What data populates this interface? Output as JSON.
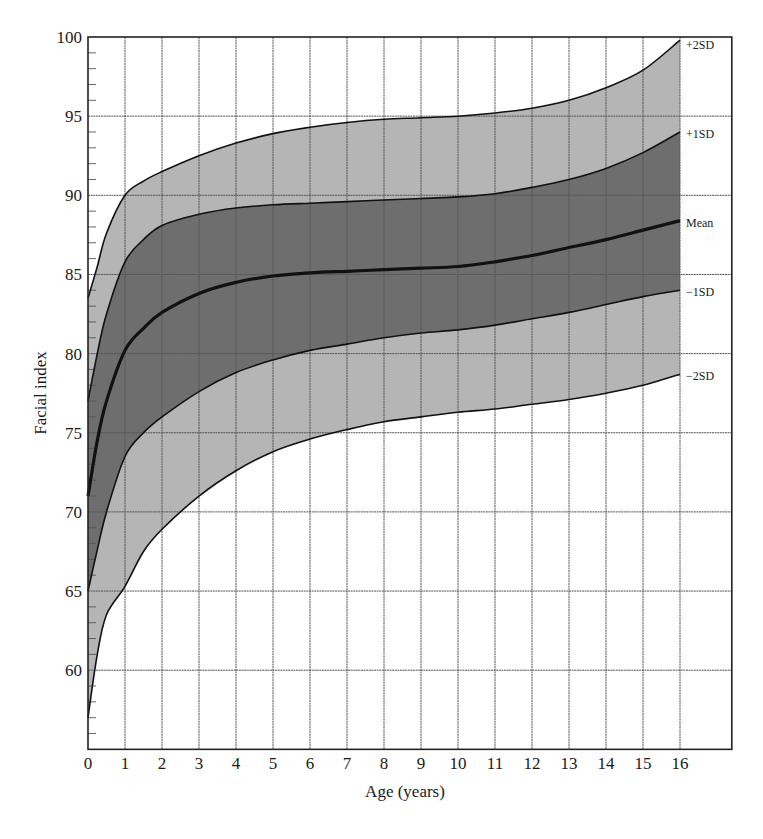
{
  "chart_data": {
    "type": "area",
    "title": "",
    "xlabel": "Age (years)",
    "ylabel": "Facial index",
    "xlim": [
      0,
      17.4
    ],
    "ylim": [
      55,
      100
    ],
    "grid": true,
    "x_ticks": [
      0,
      1,
      2,
      3,
      4,
      5,
      6,
      7,
      8,
      9,
      10,
      11,
      12,
      13,
      14,
      15,
      16
    ],
    "y_ticks": [
      60,
      65,
      70,
      75,
      80,
      85,
      90,
      95,
      100
    ],
    "x": [
      0,
      0.25,
      0.5,
      1,
      1.5,
      2,
      3,
      4,
      5,
      6,
      7,
      8,
      9,
      10,
      11,
      12,
      13,
      14,
      15,
      16
    ],
    "series": [
      {
        "name": "+2SD",
        "values": [
          83.5,
          85.5,
          87.6,
          90.0,
          90.9,
          91.5,
          92.5,
          93.3,
          93.9,
          94.3,
          94.6,
          94.8,
          94.9,
          95.0,
          95.2,
          95.5,
          96.0,
          96.8,
          97.9,
          99.8
        ]
      },
      {
        "name": "+1SD",
        "values": [
          77.0,
          80.0,
          82.5,
          85.8,
          87.2,
          88.1,
          88.8,
          89.2,
          89.4,
          89.5,
          89.6,
          89.7,
          89.8,
          89.9,
          90.1,
          90.5,
          91.0,
          91.7,
          92.7,
          94.0
        ]
      },
      {
        "name": "Mean",
        "values": [
          71.0,
          74.5,
          77.0,
          80.2,
          81.6,
          82.6,
          83.8,
          84.5,
          84.9,
          85.1,
          85.2,
          85.3,
          85.4,
          85.5,
          85.8,
          86.2,
          86.7,
          87.2,
          87.8,
          88.4
        ]
      },
      {
        "name": "-1SD",
        "values": [
          65.0,
          67.6,
          70.0,
          73.5,
          75.0,
          76.0,
          77.6,
          78.8,
          79.6,
          80.2,
          80.6,
          81.0,
          81.3,
          81.5,
          81.8,
          82.2,
          82.6,
          83.1,
          83.6,
          84.0
        ]
      },
      {
        "name": "-2SD",
        "values": [
          57.0,
          61.0,
          63.5,
          65.3,
          67.5,
          68.9,
          71.0,
          72.6,
          73.8,
          74.6,
          75.2,
          75.7,
          76.0,
          76.3,
          76.5,
          76.8,
          77.1,
          77.5,
          78.0,
          78.7
        ]
      }
    ],
    "band_labels": [
      "+2SD",
      "+1SD",
      "Mean",
      "−1SD",
      "−2SD"
    ],
    "fills": {
      "outer_band": "#b5b5b5",
      "inner_band": "#6e6e6e",
      "background": "#ffffff"
    },
    "line_color": "#111111",
    "grid_color": "#555555"
  }
}
